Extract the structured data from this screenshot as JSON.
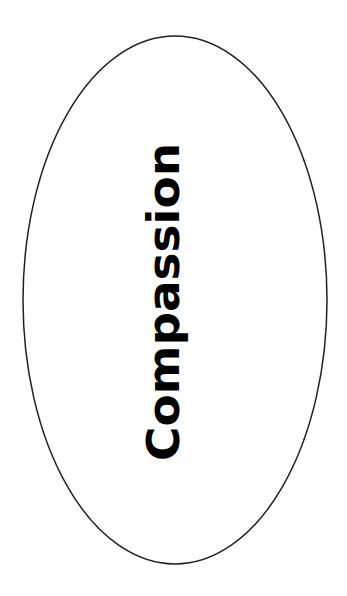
{
  "diagram": {
    "shape": "ellipse",
    "label": "Compassion",
    "stroke_color": "#222222",
    "fill_color": "#ffffff",
    "text_color": "#000000",
    "text_orientation": "vertical-bottom-to-top"
  }
}
